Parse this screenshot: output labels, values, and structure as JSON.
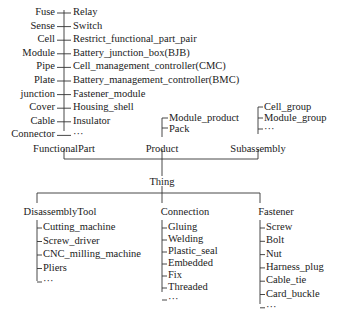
{
  "functional_part": {
    "label": "FunctionalPart",
    "left_items": [
      "Fuse",
      "Sense",
      "Cell",
      "Module",
      "Pipe",
      "Plate",
      "junction",
      "Cover",
      "Cable",
      "Connector"
    ],
    "right_items": [
      "Relay",
      "Switch",
      "Restrict_functional_part_pair",
      "Battery_junction_box(BJB)",
      "Cell_management_controller(CMC)",
      "Battery_management_controller(BMC)",
      "Fastener_module",
      "Housing_shell",
      "Insulator",
      "···"
    ]
  },
  "product": {
    "label": "Product",
    "items": [
      "Module_product",
      "Pack"
    ]
  },
  "subassembly": {
    "label": "Subassembly",
    "items": [
      "Cell_group",
      "Module_group",
      "···"
    ]
  },
  "root": {
    "label": "Thing"
  },
  "disassembly_tool": {
    "label": "DisassemblyTool",
    "items": [
      "Cutting_machine",
      "Screw_driver",
      "CNC_milling_machine",
      "Pliers",
      "···"
    ]
  },
  "connection": {
    "label": "Connection",
    "items": [
      "Gluing",
      "Welding",
      "Plastic_seal",
      "Embedded",
      "Fix",
      "Threaded",
      "···"
    ]
  },
  "fastener": {
    "label": "Fastener",
    "items": [
      "Screw",
      "Bolt",
      "Nut",
      "Harness_plug",
      "Cable_tie",
      "Card_buckle",
      "···"
    ]
  }
}
